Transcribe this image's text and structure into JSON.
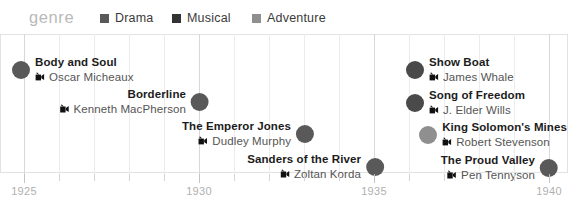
{
  "header": {
    "genre_label": "genre",
    "legend": [
      {
        "label": "Drama",
        "color": "#595959",
        "x": 100
      },
      {
        "label": "Musical",
        "color": "#333333",
        "x": 172
      },
      {
        "label": "Adventure",
        "color": "#8f8f8f",
        "x": 252
      }
    ]
  },
  "axis": {
    "ticks": [
      {
        "label": "1925",
        "x": 24,
        "major": true
      },
      {
        "label": "",
        "x": 59,
        "major": false
      },
      {
        "label": "",
        "x": 94,
        "major": false
      },
      {
        "label": "",
        "x": 129,
        "major": false
      },
      {
        "label": "",
        "x": 164,
        "major": false
      },
      {
        "label": "1930",
        "x": 199,
        "major": true
      },
      {
        "label": "",
        "x": 234,
        "major": false
      },
      {
        "label": "",
        "x": 269,
        "major": false
      },
      {
        "label": "",
        "x": 304,
        "major": false
      },
      {
        "label": "",
        "x": 339,
        "major": false
      },
      {
        "label": "1935",
        "x": 374,
        "major": true
      },
      {
        "label": "",
        "x": 409,
        "major": false
      },
      {
        "label": "",
        "x": 444,
        "major": false
      },
      {
        "label": "",
        "x": 479,
        "major": false
      },
      {
        "label": "",
        "x": 514,
        "major": false
      },
      {
        "label": "1940",
        "x": 549,
        "major": true
      }
    ]
  },
  "icons": {
    "camera": "movie-camera-icon"
  },
  "chart_data": {
    "type": "scatter",
    "title": "",
    "xlabel": "",
    "ylabel": "",
    "xlim": [
      1925,
      1940
    ],
    "grid": true,
    "legend_position": "top",
    "categories": [
      "Drama",
      "Musical",
      "Adventure"
    ],
    "colors": {
      "Drama": "#595959",
      "Musical": "#333333",
      "Adventure": "#8f8f8f"
    },
    "points": [
      {
        "title": "Body and Soul",
        "director": "Oscar Micheaux",
        "year": 1925,
        "genre": "Drama",
        "color": "#595959",
        "x": 21,
        "y": 20,
        "side": "right"
      },
      {
        "title": "Borderline",
        "director": "Kenneth MacPherson",
        "year": 1930,
        "genre": "Drama",
        "color": "#595959",
        "x": 200,
        "y": 52,
        "side": "left"
      },
      {
        "title": "The Emperor Jones",
        "director": "Dudley Murphy",
        "year": 1933,
        "genre": "Drama",
        "color": "#595959",
        "x": 305,
        "y": 84,
        "side": "left"
      },
      {
        "title": "Sanders of the River",
        "director": "Zoltan Korda",
        "year": 1935,
        "genre": "Drama",
        "color": "#595959",
        "x": 375,
        "y": 117,
        "side": "left"
      },
      {
        "title": "Show Boat",
        "director": "James Whale",
        "year": 1936,
        "genre": "Musical",
        "color": "#4a4a4a",
        "x": 415,
        "y": 20,
        "side": "right"
      },
      {
        "title": "Song of Freedom",
        "director": "J. Elder Wills",
        "year": 1936,
        "genre": "Musical",
        "color": "#4a4a4a",
        "x": 415,
        "y": 53,
        "side": "right"
      },
      {
        "title": "King Solomon's Mines",
        "director": "Robert Stevenson",
        "year": 1937,
        "genre": "Adventure",
        "color": "#8f8f8f",
        "x": 443,
        "y": 85,
        "side": "right"
      },
      {
        "title": "The Proud Valley",
        "director": "Pen Tennyson",
        "year": 1940,
        "genre": "Drama",
        "color": "#595959",
        "x": 549,
        "y": 118,
        "side": "left"
      }
    ]
  }
}
